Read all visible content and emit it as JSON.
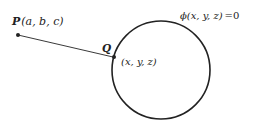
{
  "diagram": {
    "colors": {
      "stroke": "#222222",
      "background": "#ffffff"
    },
    "surface": {
      "shape": "circle",
      "center": [
        161,
        70
      ],
      "radius": 49,
      "equation_label": "ϕ(x, y, z) = 0",
      "phi": "ϕ",
      "args": "(x, y, z)",
      "eq": "=0"
    },
    "point_P": {
      "name": "P",
      "coords_label": "(a, b, c)",
      "position": [
        18,
        35
      ]
    },
    "point_Q": {
      "name": "Q",
      "coords_label": "(x, y, z)",
      "position": [
        114,
        57
      ]
    },
    "segment": {
      "from": "P",
      "to": "Q"
    }
  }
}
